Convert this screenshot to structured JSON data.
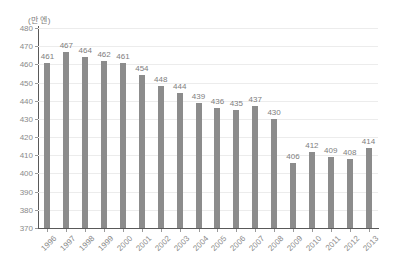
{
  "chart_data": {
    "type": "bar",
    "title": "",
    "subtitle": "",
    "unit_label": "(만 엔)",
    "xlabel": "",
    "ylabel": "",
    "ylim": [
      370,
      480
    ],
    "ytick_step": 10,
    "yticks": [
      370,
      380,
      390,
      400,
      410,
      420,
      430,
      440,
      450,
      460,
      470,
      480
    ],
    "grid": true,
    "legend": "none",
    "bar_color": "#8c8c8c",
    "gridline_color": "#ececec",
    "axis_color": "#595959",
    "text_color": "#8a8a8a",
    "categories": [
      "1996",
      "1997",
      "1998",
      "1999",
      "2000",
      "2001",
      "2002",
      "2003",
      "2004",
      "2005",
      "2006",
      "2007",
      "2008",
      "2009",
      "2010",
      "2011",
      "2012",
      "2013"
    ],
    "values": [
      461,
      467,
      464,
      462,
      461,
      454,
      448,
      444,
      439,
      436,
      435,
      437,
      430,
      406,
      412,
      409,
      408,
      414
    ],
    "data_labels": [
      "461",
      "467",
      "464",
      "462",
      "461",
      "454",
      "448",
      "444",
      "439",
      "436",
      "435",
      "437",
      "430",
      "406",
      "412",
      "409",
      "408",
      "414"
    ],
    "xtick_rotation": -45
  }
}
